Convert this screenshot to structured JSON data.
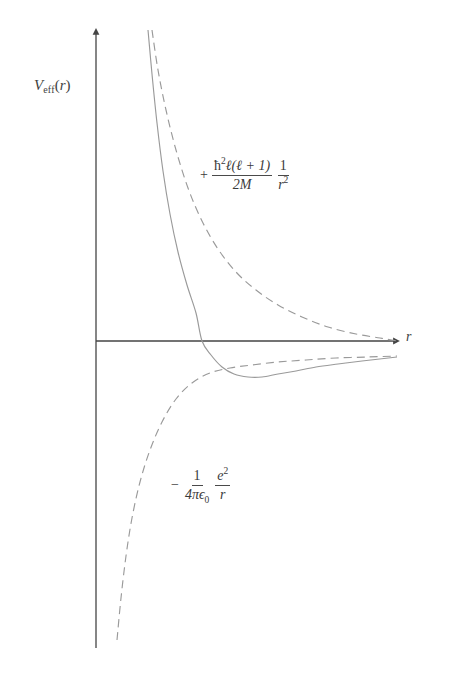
{
  "figure": {
    "background_color": "#ffffff",
    "axis_color": "#454545",
    "curve_color": "#9a9a9a",
    "text_color": "#3f3f3f"
  },
  "axes": {
    "y_label": "V",
    "y_label_sub": "eff",
    "y_label_arg": "(r)",
    "x_label": "r",
    "y_axis_x": 96,
    "y_axis_top": 30,
    "y_axis_bottom": 648,
    "x_axis_y": 341,
    "x_axis_right": 400,
    "origin_x": 96,
    "origin_y": 341
  },
  "annotations": {
    "centrifugal": {
      "sign": "+",
      "numerator_hbar": "ħ",
      "numerator_hbar_exp": "2",
      "numerator_ell": "ℓ",
      "numerator_rest": "(ℓ + 1)",
      "denominator": "2M",
      "second_numerator": "1",
      "second_denominator": "r",
      "second_denominator_exp": "2",
      "plain_text": "+ ħ²ℓ(ℓ+1)/2M · 1/r²"
    },
    "coulomb": {
      "sign": "−",
      "numerator": "1",
      "denominator_prefix": "4πϵ",
      "denominator_sub": "0",
      "second_numerator": "e",
      "second_numerator_exp": "2",
      "second_denominator": "r",
      "plain_text": "− 1/(4πϵ₀) · e²/r"
    }
  },
  "chart_data": {
    "type": "line",
    "xlabel": "r",
    "ylabel": "V_eff(r)",
    "grid": false,
    "legend": "none",
    "xlim": [
      0,
      400
    ],
    "ylim": [
      -1,
      1
    ],
    "annotations": [
      "+ ħ²ℓ(ℓ+1)/2M · 1/r²",
      "− 1/(4πϵ₀) · e²/r"
    ],
    "series": [
      {
        "name": "V_eff(r) = centrifugal + Coulomb",
        "style": "solid",
        "color": "#9a9a9a",
        "zero_crossing_x": 202,
        "minimum": {
          "x": 255,
          "y": 377
        },
        "points": [
          [
            148,
            30
          ],
          [
            152,
            74
          ],
          [
            157,
            123
          ],
          [
            163,
            171
          ],
          [
            170,
            214
          ],
          [
            178,
            252
          ],
          [
            187,
            285
          ],
          [
            196,
            313
          ],
          [
            202,
            341
          ],
          [
            211,
            355
          ],
          [
            222,
            367
          ],
          [
            234,
            374
          ],
          [
            248,
            377
          ],
          [
            262,
            377
          ],
          [
            278,
            374
          ],
          [
            296,
            371
          ],
          [
            316,
            367
          ],
          [
            338,
            364
          ],
          [
            362,
            361
          ],
          [
            397,
            357
          ]
        ]
      },
      {
        "name": "Centrifugal barrier  + ħ²ℓ(ℓ+1)/2M · 1/r²",
        "style": "dashed",
        "color": "#9a9a9a",
        "points": [
          [
            152,
            30
          ],
          [
            158,
            70
          ],
          [
            166,
            110
          ],
          [
            176,
            150
          ],
          [
            188,
            188
          ],
          [
            202,
            221
          ],
          [
            218,
            249
          ],
          [
            236,
            272
          ],
          [
            256,
            290
          ],
          [
            278,
            305
          ],
          [
            302,
            317
          ],
          [
            328,
            327
          ],
          [
            356,
            334
          ],
          [
            380,
            338
          ],
          [
            397,
            341
          ]
        ]
      },
      {
        "name": "Coulomb attraction  − 1/(4πϵ₀) · e²/r",
        "style": "dashed",
        "color": "#9a9a9a",
        "points": [
          [
            117,
            640
          ],
          [
            121,
            598
          ],
          [
            126,
            556
          ],
          [
            132,
            518
          ],
          [
            140,
            482
          ],
          [
            150,
            450
          ],
          [
            162,
            422
          ],
          [
            176,
            399
          ],
          [
            192,
            383
          ],
          [
            210,
            373
          ],
          [
            230,
            368
          ],
          [
            252,
            365
          ],
          [
            278,
            362
          ],
          [
            306,
            360
          ],
          [
            336,
            358
          ],
          [
            368,
            357
          ],
          [
            397,
            356
          ]
        ]
      }
    ]
  }
}
